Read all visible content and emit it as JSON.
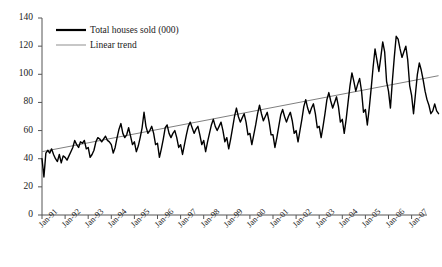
{
  "chart_data": {
    "type": "line",
    "title": "",
    "xlabel": "",
    "ylabel": "",
    "ylim": [
      0,
      140
    ],
    "yticks": [
      0,
      20,
      40,
      60,
      80,
      100,
      120,
      140
    ],
    "grid": false,
    "legend_position": "top-left",
    "x_tick_labels": [
      "Jan-91",
      "Jan-92",
      "Jan-93",
      "Jan-94",
      "Jan-95",
      "Jan-96",
      "Jan-97",
      "Jan-98",
      "Jan-99",
      "Jan-00",
      "Jan-01",
      "Jan-02",
      "Jan-03",
      "Jan-04",
      "Jan-05",
      "Jan-06",
      "Jan-07"
    ],
    "x_start": "Jan-91",
    "x_end": "Jul-07",
    "frequency": "monthly",
    "series": [
      {
        "name": "Total houses sold (000)",
        "color": "#000000",
        "style": "solid",
        "width": 1.5,
        "values": [
          40,
          27,
          44,
          46,
          44,
          47,
          43,
          40,
          38,
          43,
          37,
          42,
          41,
          39,
          42,
          45,
          48,
          53,
          50,
          48,
          52,
          51,
          53,
          47,
          48,
          41,
          43,
          46,
          52,
          55,
          54,
          52,
          54,
          56,
          53,
          52,
          50,
          44,
          48,
          55,
          61,
          65,
          58,
          55,
          57,
          62,
          56,
          50,
          52,
          45,
          49,
          55,
          62,
          73,
          63,
          58,
          60,
          63,
          58,
          50,
          51,
          41,
          47,
          54,
          62,
          64,
          58,
          55,
          58,
          60,
          55,
          48,
          50,
          43,
          50,
          57,
          63,
          66,
          62,
          58,
          61,
          63,
          57,
          50,
          53,
          45,
          52,
          58,
          64,
          68,
          63,
          60,
          63,
          66,
          60,
          52,
          55,
          47,
          54,
          62,
          70,
          76,
          70,
          66,
          69,
          72,
          66,
          57,
          58,
          50,
          57,
          64,
          72,
          78,
          72,
          67,
          70,
          73,
          66,
          57,
          57,
          48,
          55,
          63,
          71,
          75,
          70,
          66,
          70,
          73,
          67,
          58,
          60,
          52,
          60,
          68,
          77,
          82,
          76,
          72,
          76,
          79,
          72,
          62,
          63,
          55,
          63,
          72,
          82,
          87,
          81,
          76,
          80,
          84,
          77,
          66,
          68,
          58,
          68,
          80,
          92,
          101,
          95,
          88,
          93,
          97,
          88,
          73,
          75,
          64,
          76,
          90,
          105,
          118,
          110,
          102,
          112,
          123,
          116,
          95,
          88,
          76,
          95,
          112,
          127,
          125,
          118,
          112,
          116,
          120,
          110,
          92,
          85,
          72,
          86,
          100,
          108,
          103,
          96,
          88,
          82,
          78,
          72,
          74,
          79,
          74,
          72
        ]
      }
    ],
    "trend": {
      "name": "Linear trend",
      "color": "#808080",
      "style": "solid",
      "width": 1,
      "start_value": 45,
      "end_value": 99
    },
    "legend": [
      {
        "label": "Total houses sold (000)",
        "color": "#000000",
        "width": 2.2
      },
      {
        "label": "Linear trend",
        "color": "#9a9a9a",
        "width": 1.1
      }
    ]
  },
  "axes": {
    "axis_color": "#555555",
    "tick_color": "#555555"
  }
}
